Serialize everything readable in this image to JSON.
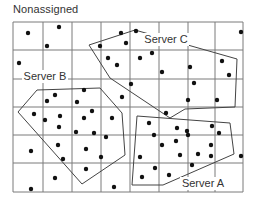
{
  "title": "Nonassigned",
  "colors": {
    "grid": "#7a7a7a",
    "polygon": "#444444",
    "dot": "#111111",
    "text": "#333333",
    "background": "#ffffff"
  },
  "grid": {
    "x_lines": [
      13,
      43,
      72,
      101,
      130,
      159,
      188,
      215,
      243
    ],
    "y_lines": [
      22,
      50,
      79,
      107,
      135,
      163,
      192
    ]
  },
  "regions": [
    {
      "name": "Server C",
      "label_x": 166,
      "label_y": 43,
      "points": [
        [
          89,
          45
        ],
        [
          135,
          30
        ],
        [
          237,
          59
        ],
        [
          235,
          107
        ],
        [
          185,
          109
        ],
        [
          170,
          118
        ],
        [
          110,
          78
        ]
      ]
    },
    {
      "name": "Server B",
      "label_x": 45,
      "label_y": 80,
      "points": [
        [
          18,
          112
        ],
        [
          37,
          90
        ],
        [
          100,
          88
        ],
        [
          122,
          113
        ],
        [
          125,
          155
        ],
        [
          82,
          184
        ]
      ]
    },
    {
      "name": "Server A",
      "label_x": 203,
      "label_y": 187,
      "points": [
        [
          137,
          116
        ],
        [
          230,
          123
        ],
        [
          234,
          154
        ],
        [
          163,
          185
        ],
        [
          132,
          185
        ]
      ]
    }
  ],
  "dots": [
    [
      28,
      33
    ],
    [
      59,
      27
    ],
    [
      47,
      46
    ],
    [
      19,
      63
    ],
    [
      121,
      33
    ],
    [
      136,
      31
    ],
    [
      100,
      46
    ],
    [
      126,
      43
    ],
    [
      108,
      58
    ],
    [
      117,
      65
    ],
    [
      140,
      58
    ],
    [
      152,
      53
    ],
    [
      162,
      72
    ],
    [
      131,
      84
    ],
    [
      241,
      32
    ],
    [
      190,
      67
    ],
    [
      222,
      61
    ],
    [
      229,
      75
    ],
    [
      194,
      83
    ],
    [
      188,
      100
    ],
    [
      217,
      100
    ],
    [
      55,
      95
    ],
    [
      47,
      101
    ],
    [
      84,
      90
    ],
    [
      77,
      102
    ],
    [
      34,
      114
    ],
    [
      45,
      120
    ],
    [
      60,
      116
    ],
    [
      84,
      118
    ],
    [
      59,
      127
    ],
    [
      76,
      132
    ],
    [
      92,
      111
    ],
    [
      94,
      133
    ],
    [
      112,
      118
    ],
    [
      106,
      137
    ],
    [
      122,
      97
    ],
    [
      31,
      151
    ],
    [
      58,
      145
    ],
    [
      86,
      149
    ],
    [
      63,
      159
    ],
    [
      101,
      157
    ],
    [
      86,
      169
    ],
    [
      55,
      178
    ],
    [
      31,
      189
    ],
    [
      114,
      187
    ],
    [
      149,
      123
    ],
    [
      166,
      113
    ],
    [
      154,
      135
    ],
    [
      177,
      128
    ],
    [
      187,
      131
    ],
    [
      188,
      135
    ],
    [
      212,
      126
    ],
    [
      219,
      133
    ],
    [
      162,
      145
    ],
    [
      176,
      141
    ],
    [
      211,
      145
    ],
    [
      140,
      157
    ],
    [
      155,
      168
    ],
    [
      142,
      177
    ],
    [
      169,
      175
    ],
    [
      192,
      165
    ],
    [
      180,
      155
    ],
    [
      198,
      154
    ],
    [
      211,
      156
    ],
    [
      241,
      156
    ]
  ]
}
